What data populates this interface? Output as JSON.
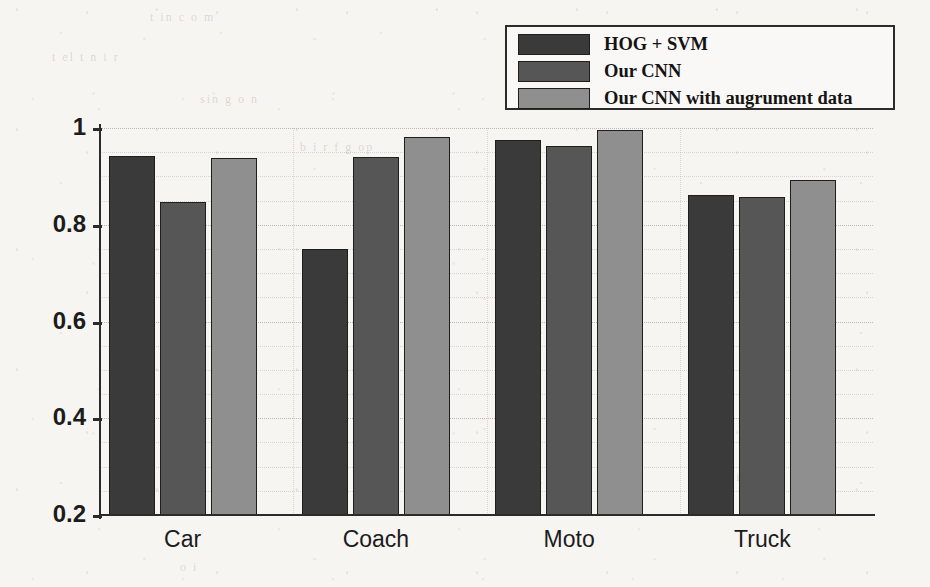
{
  "chart_data": {
    "type": "bar",
    "title": "",
    "xlabel": "",
    "ylabel": "",
    "categories": [
      "Car",
      "Coach",
      "Moto",
      "Truck"
    ],
    "series": [
      {
        "name": "HOG + SVM",
        "color": "#3a3a3a",
        "values": [
          0.942,
          0.75,
          0.975,
          0.862
        ]
      },
      {
        "name": "Our CNN",
        "color": "#565656",
        "values": [
          0.848,
          0.941,
          0.962,
          0.857
        ]
      },
      {
        "name": "Our CNN with augrument data",
        "color": "#8f8f8f",
        "values": [
          0.939,
          0.982,
          0.995,
          0.893
        ]
      }
    ],
    "ylim": [
      0.2,
      1.0
    ],
    "yticks": [
      0.2,
      0.4,
      0.6,
      0.8,
      1.0
    ],
    "ytick_labels": [
      "0.2",
      "0.4",
      "0.6",
      "0.8",
      "1"
    ],
    "grid": true,
    "grid_style": "dotted",
    "legend_position": "top-right",
    "background_color": "#f7f5f2",
    "axis_color": "#2b2b2b"
  },
  "legend": {
    "items": [
      {
        "label": "HOG + SVM"
      },
      {
        "label": "Our CNN"
      },
      {
        "label": "Our CNN with augrument data"
      }
    ]
  },
  "yaxis": {
    "ticks": [
      {
        "label": "1"
      },
      {
        "label": "0.8"
      },
      {
        "label": "0.6"
      },
      {
        "label": "0.4"
      },
      {
        "label": "0.2"
      }
    ]
  },
  "xaxis": {
    "ticks": [
      {
        "label": "Car"
      },
      {
        "label": "Coach"
      },
      {
        "label": "Moto"
      },
      {
        "label": "Truck"
      }
    ]
  },
  "scan_artifacts": {
    "ghost_lines": [
      "t  in   c   o   m",
      "t  el  t      n   i  r",
      "sin   g       o   n",
      "b  i  r      f  g   op",
      "n  o  l  i",
      "o  i"
    ]
  }
}
